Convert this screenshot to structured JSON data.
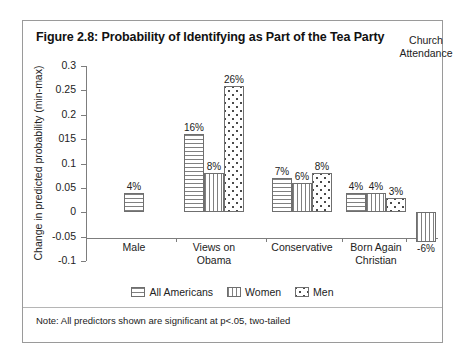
{
  "figure": {
    "title": "Figure 2.8: Probability of Identifying as Part of the Tea Party",
    "note": "Note: All predictors shown are significant at p<.05, two-tailed"
  },
  "chart_data": {
    "type": "bar",
    "title": "Figure 2.8: Probability of Identifying as Part of the Tea Party",
    "xlabel": "",
    "ylabel": "Change in predicted probability (min-max)",
    "ylim": [
      -0.1,
      0.3
    ],
    "ytick_labels": [
      "0.3",
      "0.25",
      "0.2",
      "015",
      "0.1",
      "0.05",
      "0",
      "-0.05",
      "-0.1"
    ],
    "ytick_values": [
      0.3,
      0.25,
      0.2,
      0.15,
      0.1,
      0.05,
      0,
      -0.05,
      -0.1
    ],
    "grid": false,
    "legend_position": "bottom",
    "categories": [
      "Male",
      "Views on Obama",
      "Conservative",
      "Born Again Christian",
      "Church Attendance"
    ],
    "series": [
      {
        "name": "All Americans",
        "pattern": "horizontal-lines",
        "values": [
          0.04,
          0.16,
          0.07,
          0.04,
          null
        ],
        "labels": [
          "4%",
          "16%",
          "7%",
          "4%",
          null
        ]
      },
      {
        "name": "Women",
        "pattern": "vertical-lines",
        "values": [
          null,
          0.08,
          0.06,
          0.04,
          -0.06
        ],
        "labels": [
          null,
          "8%",
          "6%",
          "4%",
          "-6%"
        ]
      },
      {
        "name": "Men",
        "pattern": "dots",
        "values": [
          null,
          0.26,
          0.08,
          0.03,
          null
        ],
        "labels": [
          null,
          "26%",
          "8%",
          "3%",
          null
        ]
      }
    ]
  },
  "legend": {
    "items": [
      {
        "label": "All Americans",
        "pattern": "horizontal-lines"
      },
      {
        "label": "Women",
        "pattern": "vertical-lines"
      },
      {
        "label": "Men",
        "pattern": "dots"
      }
    ]
  },
  "groups": [
    {
      "label_line1": "Male",
      "label_line2": ""
    },
    {
      "label_line1": "Views on",
      "label_line2": "Obama"
    },
    {
      "label_line1": "Conservative",
      "label_line2": ""
    },
    {
      "label_line1": "Born Again",
      "label_line2": "Christian"
    },
    {
      "label_line1": "Church",
      "label_line2": "Attendance"
    }
  ]
}
